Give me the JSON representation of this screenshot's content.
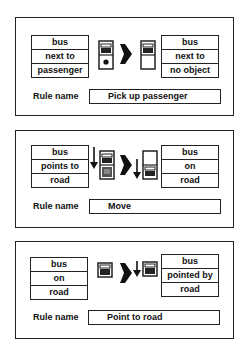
{
  "rules": [
    {
      "before": [
        "bus",
        "next to",
        "passenger"
      ],
      "after": [
        "bus",
        "next to",
        "no object"
      ],
      "rule_name_label": "Rule name",
      "rule_name": "Pick up passenger",
      "icons": {
        "before": "vehicle-with-passenger-icon",
        "transition": "right-arrow-icon",
        "after": "vehicle-empty-icon"
      }
    },
    {
      "before": [
        "bus",
        "points to",
        "road"
      ],
      "after": [
        "bus",
        "on",
        "road"
      ],
      "rule_name_label": "Rule name",
      "rule_name": "Move",
      "icons": {
        "before": "down-pointer-vehicle-on-road-icon",
        "transition": "right-arrow-icon",
        "after": "down-pointer-vehicle-moved-icon"
      }
    },
    {
      "before": [
        "bus",
        "on",
        "road"
      ],
      "after": [
        "bus",
        "pointed by",
        "road"
      ],
      "rule_name_label": "Rule name",
      "rule_name": "Point to road",
      "icons": {
        "before": "road-tile-icon",
        "transition": "right-arrow-icon",
        "after": "down-pointer-road-tile-icon"
      }
    }
  ]
}
